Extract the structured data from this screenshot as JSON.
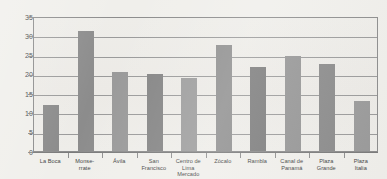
{
  "chart_data": {
    "type": "bar",
    "title": "",
    "subtitle": "",
    "xlabel": "",
    "ylabel": "",
    "ylim": [
      0,
      35
    ],
    "yticks": [
      0,
      5,
      10,
      15,
      20,
      25,
      30,
      35
    ],
    "grid": true,
    "legend": false,
    "categories": [
      "La Boca",
      "Monse-\nrrate",
      "Ávila",
      "San\nFrancisco",
      "Centro de\nLima\nMercado",
      "Zócalo",
      "Rambla",
      "Canal de\nPanamá",
      "Plaza\nGrande",
      "Plaza\nItalia"
    ],
    "category_lines": [
      [
        "La Boca"
      ],
      [
        "Monse-",
        "rrate"
      ],
      [
        "Ávila"
      ],
      [
        "San",
        "Francisco"
      ],
      [
        "Centro de",
        "Lima",
        "Mercado"
      ],
      [
        "Zócalo"
      ],
      [
        "Rambla"
      ],
      [
        "Canal de",
        "Panamá"
      ],
      [
        "Plaza",
        "Grande"
      ],
      [
        "Plaza",
        "Italia"
      ]
    ],
    "values": [
      12,
      31,
      20.5,
      20,
      19,
      27.5,
      21.8,
      24.7,
      22.5,
      13
    ],
    "bar_colors": [
      "#8a8a8a",
      "#8c8c8c",
      "#999999",
      "#858585",
      "#9d9d9d",
      "#909090",
      "#7e7e7e",
      "#969696",
      "#8b8b8b",
      "#9a9a9a"
    ]
  },
  "style": {
    "page_background": "#f0efeb",
    "plot_background": "#edece8",
    "gridline_color": "#9a9a9a",
    "axis_color": "#8c8c8c",
    "tick_label_color": "#4a4a4a",
    "category_label_color": "#3f3f3f"
  }
}
